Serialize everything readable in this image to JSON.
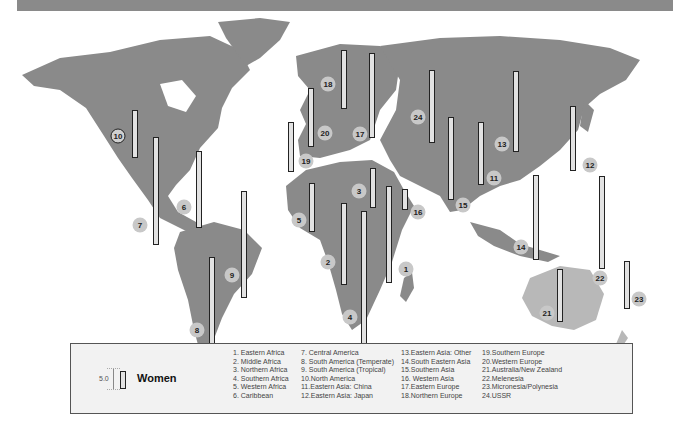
{
  "legend": {
    "title": "Women",
    "scale_value": "5.0",
    "columns": [
      [
        "1.  Eastern Africa",
        "2.  Middle Africa",
        "3.  Northern Africa",
        "4.  Southern Africa",
        "5.  Western Africa",
        "6.  Caribbean"
      ],
      [
        "7.  Central America",
        "8.  South America (Temperate)",
        "9.  South America (Tropical)",
        "10.North America",
        "11.Eastern Asia: China",
        "12.Eastern Asia: Japan"
      ],
      [
        "13.Eastern Asia: Other",
        "14.South Eastern Asia",
        "15.Southern Asia",
        "16. Western Asia",
        "17.Eastern Europe",
        "18.Northern Europe"
      ],
      [
        "19.Southern Europe",
        "20.Western Europe",
        "21.Australia/New Zealand",
        "22.Melenesia",
        "23.Micronesia/Polynesia",
        "24.USSR"
      ]
    ]
  },
  "regions": [
    {
      "id": "1",
      "name": "Eastern Africa",
      "label_x": 406,
      "label_y": 269,
      "bar_x": 386,
      "bar_top": 186,
      "bar_bottom": 281
    },
    {
      "id": "2",
      "name": "Middle Africa",
      "label_x": 328,
      "label_y": 262,
      "bar_x": 341,
      "bar_top": 203,
      "bar_bottom": 283
    },
    {
      "id": "3",
      "name": "Northern Africa",
      "label_x": 359,
      "label_y": 191,
      "bar_x": 370,
      "bar_top": 168,
      "bar_bottom": 206
    },
    {
      "id": "4",
      "name": "Southern Africa",
      "label_x": 350,
      "label_y": 317,
      "bar_x": 361,
      "bar_top": 211,
      "bar_bottom": 349
    },
    {
      "id": "5",
      "name": "Western Africa",
      "label_x": 299,
      "label_y": 220,
      "bar_x": 309,
      "bar_top": 183,
      "bar_bottom": 230
    },
    {
      "id": "6",
      "name": "Caribbean",
      "label_x": 184,
      "label_y": 207,
      "bar_x": 196,
      "bar_top": 151,
      "bar_bottom": 226
    },
    {
      "id": "7",
      "name": "Central America",
      "label_x": 140,
      "label_y": 225,
      "bar_x": 153,
      "bar_top": 137,
      "bar_bottom": 243
    },
    {
      "id": "8",
      "name": "South America (Temperate)",
      "label_x": 197,
      "label_y": 330,
      "bar_x": 209,
      "bar_top": 257,
      "bar_bottom": 354
    },
    {
      "id": "9",
      "name": "South America (Tropical)",
      "label_x": 232,
      "label_y": 275,
      "bar_x": 241,
      "bar_top": 191,
      "bar_bottom": 296
    },
    {
      "id": "10",
      "name": "North America",
      "label_x": 118,
      "label_y": 136,
      "bar_x": 132,
      "bar_top": 110,
      "bar_bottom": 156,
      "outlined": true
    },
    {
      "id": "11",
      "name": "Eastern Asia: China",
      "label_x": 494,
      "label_y": 178,
      "bar_x": 478,
      "bar_top": 122,
      "bar_bottom": 183
    },
    {
      "id": "12",
      "name": "Eastern Asia: Japan",
      "label_x": 590,
      "label_y": 165,
      "bar_x": 570,
      "bar_top": 106,
      "bar_bottom": 169
    },
    {
      "id": "13",
      "name": "Eastern Asia: Other",
      "label_x": 502,
      "label_y": 144,
      "bar_x": 513,
      "bar_top": 71,
      "bar_bottom": 150
    },
    {
      "id": "14",
      "name": "South Eastern Asia",
      "label_x": 521,
      "label_y": 247,
      "bar_x": 533,
      "bar_top": 175,
      "bar_bottom": 258
    },
    {
      "id": "15",
      "name": "Southern Asia",
      "label_x": 463,
      "label_y": 205,
      "bar_x": 448,
      "bar_top": 117,
      "bar_bottom": 198
    },
    {
      "id": "16",
      "name": "Western Asia",
      "label_x": 418,
      "label_y": 212,
      "bar_x": 402,
      "bar_top": 189,
      "bar_bottom": 208
    },
    {
      "id": "17",
      "name": "Eastern Europe",
      "label_x": 360,
      "label_y": 134,
      "bar_x": 369,
      "bar_top": 53,
      "bar_bottom": 136
    },
    {
      "id": "18",
      "name": "Northern Europe",
      "label_x": 328,
      "label_y": 84,
      "bar_x": 341,
      "bar_top": 50,
      "bar_bottom": 107
    },
    {
      "id": "19",
      "name": "Southern Europe",
      "label_x": 306,
      "label_y": 161,
      "bar_x": 288,
      "bar_top": 122,
      "bar_bottom": 170
    },
    {
      "id": "20",
      "name": "Western Europe",
      "label_x": 325,
      "label_y": 133,
      "bar_x": 308,
      "bar_top": 88,
      "bar_bottom": 145
    },
    {
      "id": "21",
      "name": "Australia/New Zealand",
      "label_x": 547,
      "label_y": 313,
      "bar_x": 557,
      "bar_top": 269,
      "bar_bottom": 320
    },
    {
      "id": "22",
      "name": "Melenesia",
      "label_x": 600,
      "label_y": 278,
      "bar_x": 599,
      "bar_top": 176,
      "bar_bottom": 267
    },
    {
      "id": "23",
      "name": "Micronesia/Polynesia",
      "label_x": 639,
      "label_y": 299,
      "bar_x": 624,
      "bar_top": 261,
      "bar_bottom": 307
    },
    {
      "id": "24",
      "name": "USSR",
      "label_x": 418,
      "label_y": 117,
      "bar_x": 429,
      "bar_top": 70,
      "bar_bottom": 141
    }
  ]
}
